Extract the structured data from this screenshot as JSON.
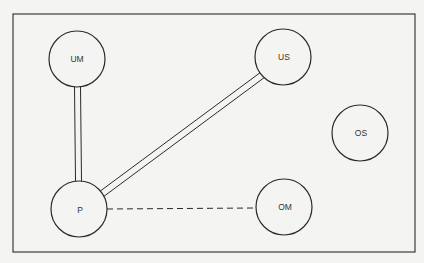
{
  "diagram": {
    "frame": {
      "x": 13,
      "y": 14,
      "width": 402,
      "height": 238
    },
    "colors": {
      "stroke": "#2a2a2a",
      "background": "#f4f4f2",
      "fill": "#f4f4f2"
    },
    "nodes": [
      {
        "id": "UM",
        "label": "UM",
        "cx": 77,
        "cy": 59,
        "r": 28
      },
      {
        "id": "US",
        "label": "US",
        "cx": 283,
        "cy": 57,
        "r": 28
      },
      {
        "id": "OS",
        "label": "OS",
        "cx": 360,
        "cy": 133,
        "r": 28
      },
      {
        "id": "P",
        "label": "P",
        "cx": 79,
        "cy": 209,
        "r": 28
      },
      {
        "id": "OM",
        "label": "OM",
        "cx": 284,
        "cy": 207,
        "r": 28
      }
    ],
    "edges": [
      {
        "from": "UM",
        "to": "P",
        "style": "double"
      },
      {
        "from": "P",
        "to": "US",
        "style": "double"
      },
      {
        "from": "P",
        "to": "OM",
        "style": "dashed"
      }
    ]
  }
}
